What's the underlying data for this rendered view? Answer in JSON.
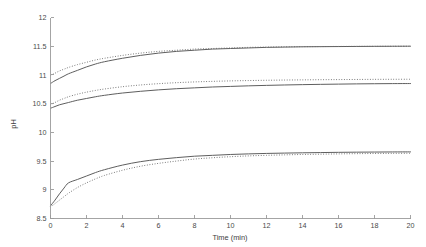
{
  "chart_data": {
    "type": "line",
    "title": "",
    "subtitle": "",
    "xlabel": "Time (min)",
    "ylabel": "pH",
    "xlim": [
      0,
      20
    ],
    "ylim": [
      8.5,
      12
    ],
    "xticks": [
      0,
      2,
      4,
      6,
      8,
      10,
      12,
      14,
      16,
      18,
      20
    ],
    "xtick_labels": [
      "0",
      "2",
      "4",
      "6",
      "8",
      "10",
      "12",
      "14",
      "16",
      "18",
      "20"
    ],
    "yticks": [
      8.5,
      9,
      9.5,
      10,
      10.5,
      11,
      11.5,
      12
    ],
    "ytick_labels": [
      "8.5",
      "9",
      "9.5",
      "10",
      "10.5",
      "11",
      "11.5",
      "12"
    ],
    "grid": false,
    "legend": null,
    "legend_position": "none",
    "x": [
      0,
      0.25,
      0.5,
      0.75,
      1,
      1.5,
      2,
      2.5,
      3,
      4,
      5,
      6,
      7,
      8,
      9,
      10,
      11,
      12,
      13,
      14,
      15,
      16,
      17,
      18,
      19,
      20
    ],
    "series": [
      {
        "name": "upper-solid",
        "style": "solid",
        "color": "#555555",
        "values": [
          10.85,
          10.9,
          10.94,
          10.98,
          11.02,
          11.08,
          11.14,
          11.19,
          11.23,
          11.29,
          11.34,
          11.38,
          11.41,
          11.43,
          11.45,
          11.46,
          11.47,
          11.48,
          11.485,
          11.49,
          11.492,
          11.494,
          11.496,
          11.498,
          11.499,
          11.5
        ]
      },
      {
        "name": "upper-dotted",
        "style": "dotted",
        "color": "#686868",
        "values": [
          10.99,
          11.03,
          11.07,
          11.1,
          11.13,
          11.18,
          11.22,
          11.26,
          11.29,
          11.34,
          11.38,
          11.41,
          11.43,
          11.45,
          11.46,
          11.47,
          11.48,
          11.485,
          11.49,
          11.492,
          11.494,
          11.496,
          11.497,
          11.498,
          11.499,
          11.5
        ]
      },
      {
        "name": "middle-solid",
        "style": "solid",
        "color": "#555555",
        "values": [
          10.42,
          10.45,
          10.48,
          10.5,
          10.52,
          10.56,
          10.59,
          10.62,
          10.645,
          10.685,
          10.715,
          10.74,
          10.76,
          10.775,
          10.79,
          10.8,
          10.81,
          10.818,
          10.825,
          10.831,
          10.836,
          10.84,
          10.844,
          10.847,
          10.849,
          10.85
        ]
      },
      {
        "name": "middle-dotted",
        "style": "dotted",
        "color": "#686868",
        "values": [
          10.48,
          10.52,
          10.56,
          10.59,
          10.62,
          10.665,
          10.7,
          10.73,
          10.755,
          10.795,
          10.825,
          10.848,
          10.865,
          10.878,
          10.888,
          10.896,
          10.902,
          10.907,
          10.911,
          10.914,
          10.917,
          10.919,
          10.921,
          10.923,
          10.924,
          10.925
        ]
      },
      {
        "name": "lower-solid",
        "style": "solid",
        "color": "#555555",
        "values": [
          8.72,
          8.82,
          8.93,
          9.03,
          9.12,
          9.18,
          9.24,
          9.3,
          9.35,
          9.43,
          9.49,
          9.53,
          9.56,
          9.585,
          9.6,
          9.615,
          9.625,
          9.633,
          9.639,
          9.644,
          9.648,
          9.652,
          9.655,
          9.657,
          9.659,
          9.66
        ]
      },
      {
        "name": "lower-dotted",
        "style": "dotted",
        "color": "#686868",
        "values": [
          8.7,
          8.76,
          8.82,
          8.88,
          8.94,
          9.04,
          9.12,
          9.19,
          9.25,
          9.34,
          9.41,
          9.46,
          9.5,
          9.535,
          9.558,
          9.576,
          9.59,
          9.6,
          9.608,
          9.615,
          9.62,
          9.625,
          9.629,
          9.632,
          9.634,
          9.636
        ]
      }
    ]
  },
  "axes": {
    "y_axis_name": "y-axis",
    "x_axis_name": "x-axis"
  }
}
